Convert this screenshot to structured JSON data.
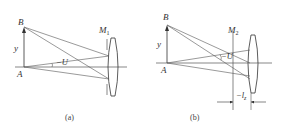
{
  "panels": [
    {
      "id": "a",
      "caption": "(a)",
      "point_top": "B",
      "point_bottom": "A",
      "height_label": "y",
      "angle_label": "−U",
      "stop_label": "M",
      "stop_sub": "1"
    },
    {
      "id": "b",
      "caption": "(b)",
      "point_top": "B",
      "point_bottom": "A",
      "height_label": "y",
      "angle_label": "−U",
      "stop_label": "M",
      "stop_sub": "2",
      "distance_label": "−l",
      "distance_sub": "z"
    }
  ],
  "colors": {
    "line": "#555555",
    "text": "#333333",
    "background": "#ffffff"
  }
}
